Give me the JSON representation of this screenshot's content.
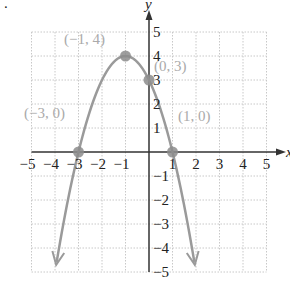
{
  "chart_data": {
    "type": "line",
    "title": "",
    "function": "y = -x^2 - 2x + 3",
    "xlabel": "x",
    "ylabel": "y",
    "xlim": [
      -5,
      5
    ],
    "ylim": [
      -5,
      5
    ],
    "grid": true,
    "x_ticks": [
      "−5",
      "−4",
      "−3",
      "−2",
      "−1",
      "1",
      "2",
      "3",
      "4",
      "5"
    ],
    "y_ticks": [
      "5",
      "4",
      "3",
      "2",
      "1",
      "−1",
      "−2",
      "−3",
      "−4",
      "−5"
    ],
    "series": [
      {
        "name": "parabola",
        "x": [
          -4,
          -3,
          -2,
          -1,
          0,
          1,
          2
        ],
        "y": [
          -5,
          0,
          3,
          4,
          3,
          0,
          -5
        ]
      }
    ],
    "annotations": [
      {
        "label": "(−1, 4)",
        "x": -1,
        "y": 4
      },
      {
        "label": "(0, 3)",
        "x": 0,
        "y": 3
      },
      {
        "label": "(−3, 0)",
        "x": -3,
        "y": 0
      },
      {
        "label": "(1, 0)",
        "x": 1,
        "y": 0
      }
    ]
  },
  "colors": {
    "curve": "#9a9a9a",
    "point": "#8c8c8c",
    "axis": "#333333",
    "grid": "#c8c8c8",
    "label": "#aaaaaa"
  },
  "corner_mark": "."
}
